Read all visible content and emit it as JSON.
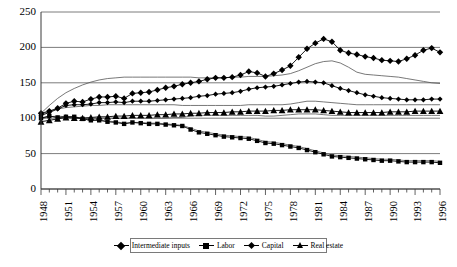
{
  "chart_data": {
    "type": "line",
    "title": "",
    "xlabel": "",
    "ylabel": "",
    "ylim": [
      0,
      250
    ],
    "ytick_values": [
      0,
      50,
      100,
      150,
      200,
      250
    ],
    "grid": true,
    "legend_position": "bottom",
    "x_start": 1948,
    "x_end": 1996,
    "x_tick_step": 1,
    "x_label_step": 3,
    "xtick_labels": [
      "1948",
      "1951",
      "1954",
      "1957",
      "1960",
      "1963",
      "1966",
      "1969",
      "1972",
      "1975",
      "1978",
      "1981",
      "1984",
      "1987",
      "1990",
      "1993",
      "1996"
    ],
    "x": [
      1948,
      1949,
      1950,
      1951,
      1952,
      1953,
      1954,
      1955,
      1956,
      1957,
      1958,
      1959,
      1960,
      1961,
      1962,
      1963,
      1964,
      1965,
      1966,
      1967,
      1968,
      1969,
      1970,
      1971,
      1972,
      1973,
      1974,
      1975,
      1976,
      1977,
      1978,
      1979,
      1980,
      1981,
      1982,
      1983,
      1984,
      1985,
      1986,
      1987,
      1988,
      1989,
      1990,
      1991,
      1992,
      1993,
      1994,
      1995,
      1996
    ],
    "series": [
      {
        "name": "Intermediate inputs",
        "marker": "diamond",
        "color": "#000000",
        "values": [
          107,
          110,
          114,
          121,
          124,
          123,
          127,
          130,
          130,
          131,
          128,
          135,
          136,
          137,
          140,
          143,
          145,
          148,
          150,
          152,
          155,
          157,
          157,
          158,
          161,
          166,
          164,
          159,
          163,
          168,
          174,
          186,
          198,
          206,
          212,
          208,
          196,
          192,
          190,
          187,
          185,
          182,
          181,
          180,
          184,
          189,
          196,
          199,
          193
        ]
      },
      {
        "name": "Labor",
        "marker": "square",
        "color": "#000000",
        "values": [
          100,
          103,
          101,
          102,
          102,
          99,
          97,
          97,
          95,
          94,
          92,
          94,
          93,
          92,
          92,
          91,
          90,
          89,
          84,
          80,
          78,
          76,
          74,
          73,
          72,
          71,
          68,
          65,
          64,
          62,
          60,
          58,
          55,
          52,
          49,
          46,
          45,
          44,
          43,
          42,
          41,
          40,
          40,
          39,
          38,
          38,
          38,
          38,
          37
        ]
      },
      {
        "name": "Capital",
        "marker": "smalldiamond",
        "color": "#000000",
        "values": [
          104,
          108,
          113,
          118,
          119,
          119,
          120,
          122,
          122,
          123,
          122,
          124,
          124,
          124,
          125,
          126,
          127,
          128,
          129,
          131,
          132,
          134,
          135,
          136,
          138,
          141,
          143,
          144,
          145,
          147,
          149,
          151,
          152,
          151,
          150,
          146,
          142,
          139,
          136,
          133,
          131,
          129,
          128,
          127,
          126,
          126,
          126,
          127,
          127
        ]
      },
      {
        "name": "Real estate",
        "marker": "triangle",
        "color": "#000000",
        "values": [
          95,
          97,
          99,
          101,
          100,
          100,
          101,
          102,
          102,
          103,
          103,
          104,
          104,
          104,
          105,
          105,
          106,
          106,
          107,
          107,
          108,
          108,
          108,
          109,
          109,
          110,
          110,
          110,
          111,
          111,
          112,
          112,
          112,
          112,
          111,
          110,
          109,
          108,
          108,
          108,
          108,
          108,
          109,
          109,
          109,
          110,
          110,
          110,
          110
        ]
      }
    ],
    "trend_lines": [
      {
        "name": "trend-upper",
        "values": [
          107,
          118,
          128,
          136,
          142,
          147,
          151,
          154,
          156,
          157,
          158,
          158,
          158,
          158,
          158,
          158,
          158,
          158,
          158,
          157,
          157,
          157,
          157,
          158,
          158,
          159,
          159,
          159,
          160,
          161,
          163,
          167,
          172,
          177,
          180,
          181,
          178,
          172,
          165,
          162,
          161,
          160,
          159,
          158,
          156,
          154,
          152,
          150,
          149
        ]
      },
      {
        "name": "trend-mid",
        "values": [
          105,
          110,
          113,
          115,
          116,
          117,
          118,
          118,
          119,
          119,
          119,
          119,
          119,
          119,
          119,
          119,
          119,
          118,
          118,
          118,
          118,
          118,
          118,
          118,
          118,
          119,
          119,
          119,
          119,
          119,
          120,
          122,
          124,
          124,
          123,
          122,
          121,
          120,
          119,
          119,
          119,
          119,
          119,
          119,
          119,
          119,
          119,
          119,
          119
        ]
      },
      {
        "name": "trend-lower",
        "values": [
          99,
          102,
          103,
          102,
          101,
          100,
          100,
          100,
          100,
          100,
          100,
          100,
          100,
          100,
          100,
          100,
          101,
          101,
          103,
          104,
          104,
          104,
          104,
          104,
          104,
          104,
          104,
          103,
          103,
          104,
          105,
          106,
          106,
          106,
          105,
          104,
          104,
          104,
          104,
          104,
          104,
          104,
          104,
          104,
          104,
          104,
          104,
          104,
          104
        ]
      },
      {
        "name": "trend-bottom",
        "values": [
          100,
          103,
          101,
          102,
          102,
          100,
          98,
          97,
          96,
          95,
          93,
          94,
          94,
          93,
          93,
          92,
          91,
          90,
          86,
          82,
          80,
          78,
          76,
          75,
          74,
          73,
          70,
          67,
          66,
          64,
          62,
          60,
          57,
          54,
          51,
          48,
          47,
          46,
          45,
          44,
          43,
          42,
          42,
          41,
          40,
          40,
          40,
          40,
          39
        ]
      }
    ]
  },
  "legend": {
    "items": [
      {
        "label": "Intermediate inputs",
        "marker": "diamond"
      },
      {
        "label": "Labor",
        "marker": "square"
      },
      {
        "label": "Capital",
        "marker": "smalldiamond"
      },
      {
        "label": "Real estate",
        "marker": "triangle"
      }
    ]
  }
}
